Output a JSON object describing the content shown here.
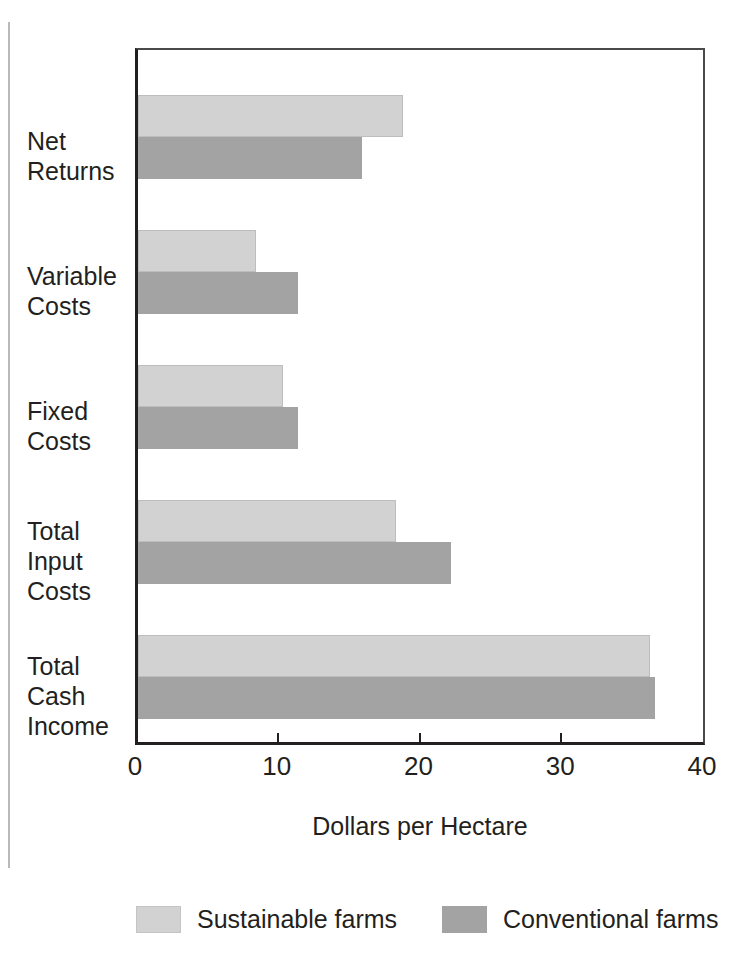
{
  "chart_data": {
    "type": "bar",
    "orientation": "horizontal",
    "title": "",
    "xlabel": "Dollars per Hectare",
    "ylabel": "",
    "xlim": [
      0,
      40
    ],
    "xticks": [
      0,
      10,
      20,
      30,
      40
    ],
    "xtick_labels": [
      "0",
      "10",
      "20",
      "30",
      "40"
    ],
    "grid": false,
    "legend_position": "bottom",
    "categories": [
      "Net Returns",
      "Variable Costs",
      "Fixed Costs",
      "Total Input Costs",
      "Total Cash Income"
    ],
    "category_lines": [
      [
        "Net",
        "Returns"
      ],
      [
        "Variable",
        "Costs"
      ],
      [
        "Fixed",
        "Costs"
      ],
      [
        "Total",
        "Input",
        "Costs"
      ],
      [
        "Total",
        "Cash",
        "Income"
      ]
    ],
    "series": [
      {
        "name": "Sustainable farms",
        "color": "#d2d2d2",
        "values": [
          18.7,
          8.3,
          10.2,
          18.2,
          36.1
        ]
      },
      {
        "name": "Conventional farms",
        "color": "#a3a3a3",
        "values": [
          15.8,
          11.3,
          11.3,
          22.1,
          36.5
        ]
      }
    ]
  },
  "axis": {
    "title": "Dollars per Hectare",
    "tick_0": "0",
    "tick_1": "10",
    "tick_2": "20",
    "tick_3": "30",
    "tick_4": "40"
  },
  "labels": {
    "cat0_l0": "Net",
    "cat0_l1": "Returns",
    "cat1_l0": "Variable",
    "cat1_l1": "Costs",
    "cat2_l0": "Fixed",
    "cat2_l1": "Costs",
    "cat3_l0": "Total",
    "cat3_l1": "Input",
    "cat3_l2": "Costs",
    "cat4_l0": "Total",
    "cat4_l1": "Cash",
    "cat4_l2": "Income"
  },
  "legend": {
    "item0": "Sustainable farms",
    "item1": "Conventional farms"
  },
  "colors": {
    "sustainable": "#d2d2d2",
    "conventional": "#a3a3a3",
    "axis": "#231f20"
  }
}
